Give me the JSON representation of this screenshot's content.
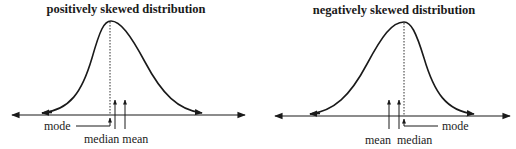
{
  "panels": [
    {
      "title": "positively skewed distribution",
      "skew": "positive",
      "labels": {
        "mode": "mode",
        "median": "median",
        "mean": "mean",
        "median_mean": "median mean"
      },
      "order_left_to_right": [
        "mode",
        "median",
        "mean"
      ]
    },
    {
      "title": "negatively skewed distribution",
      "skew": "negative",
      "labels": {
        "mode": "mode",
        "median": "median",
        "mean": "mean",
        "mean_median": "mean  median"
      },
      "order_left_to_right": [
        "mean",
        "median",
        "mode"
      ]
    }
  ],
  "colors": {
    "line": "#1a1a1a",
    "background": "#ffffff"
  }
}
